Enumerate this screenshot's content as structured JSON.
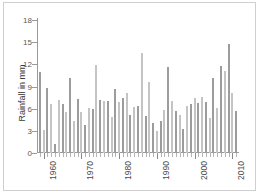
{
  "figure": {
    "background_color": "#ffffff",
    "border_color": "#cfcfcf"
  },
  "chart_data": {
    "type": "bar",
    "title": "",
    "subtitle": "",
    "xlabel": "",
    "ylabel": "Rainfall  in mm",
    "ylim": [
      0,
      18
    ],
    "y_ticks": [
      0,
      3,
      6,
      9,
      12,
      15,
      18
    ],
    "y_tick_labels": [
      "0",
      "3",
      "6",
      "9",
      "12",
      "15",
      "18"
    ],
    "xlim": [
      1958.5,
      2011.5
    ],
    "x_ticks": [
      1960,
      1970,
      1980,
      1990,
      2000,
      2010
    ],
    "x_tick_labels": [
      "1960",
      "1970",
      "1980",
      "1990",
      "2000",
      "2010"
    ],
    "x_tick_label_rotation": -90,
    "grid": false,
    "legend": null,
    "bar_color_light": "#c4c4c4",
    "bar_color_dark": "#9c9c9c",
    "axis_color": "#9a9a9a",
    "categories": [
      1959,
      1960,
      1961,
      1962,
      1963,
      1964,
      1965,
      1966,
      1967,
      1968,
      1969,
      1970,
      1971,
      1972,
      1973,
      1974,
      1975,
      1976,
      1977,
      1978,
      1979,
      1980,
      1981,
      1982,
      1983,
      1984,
      1985,
      1986,
      1987,
      1988,
      1989,
      1990,
      1991,
      1992,
      1993,
      1994,
      1995,
      1996,
      1997,
      1998,
      1999,
      2000,
      2001,
      2002,
      2003,
      2004,
      2005,
      2006,
      2007,
      2008,
      2009,
      2010,
      2011
    ],
    "values": [
      11.0,
      3.1,
      8.8,
      6.7,
      1.2,
      7.2,
      6.6,
      5.5,
      10.2,
      4.4,
      7.3,
      5.6,
      3.8,
      6.1,
      5.9,
      11.9,
      7.2,
      7.1,
      7.0,
      4.9,
      8.6,
      6.9,
      7.5,
      8.1,
      5.2,
      6.2,
      6.3,
      13.5,
      5.0,
      9.6,
      4.1,
      3.0,
      4.4,
      5.8,
      11.6,
      7.0,
      5.7,
      5.1,
      3.2,
      6.3,
      6.6,
      7.4,
      6.8,
      7.6,
      6.9,
      4.7,
      10.1,
      6.1,
      11.8,
      11.1,
      14.8,
      8.1,
      5.7
    ]
  }
}
